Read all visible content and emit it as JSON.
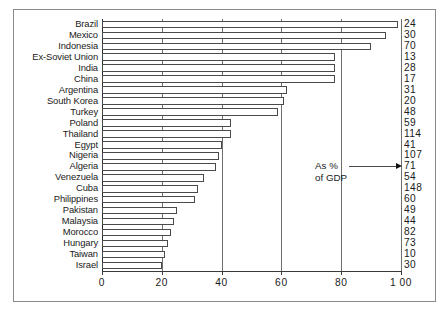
{
  "chart_data": {
    "type": "bar",
    "orientation": "horizontal",
    "title": "",
    "subtitle": "",
    "xlabel": "",
    "ylabel": "",
    "xlim": [
      0,
      100
    ],
    "grid": true,
    "gridlines_at": [
      0,
      20,
      40,
      60,
      80,
      100
    ],
    "xticks": [
      "0",
      "20",
      "40",
      "60",
      "80",
      "1 00"
    ],
    "xtick_values": [
      0,
      20,
      40,
      60,
      80,
      100
    ],
    "categories": [
      "Brazil",
      "Mexico",
      "Indonesia",
      "Ex-Soviet Union",
      "India",
      "China",
      "Argentina",
      "South Korea",
      "Turkey",
      "Poland",
      "Thailand",
      "Egypt",
      "Nigeria",
      "Algeria",
      "Venezuela",
      "Cuba",
      "Philippines",
      "Pakistan",
      "Malaysia",
      "Morocco",
      "Hungary",
      "Taiwan",
      "Israel"
    ],
    "values": [
      99,
      95,
      90,
      78,
      78,
      78,
      62,
      61,
      59,
      43,
      43,
      40,
      39,
      38,
      34,
      32,
      31,
      25,
      24,
      23,
      22,
      21,
      20
    ],
    "right_column_label": "",
    "right_column_values": [
      "24",
      "30",
      "70",
      "13",
      "28",
      "17",
      "31",
      "20",
      "48",
      "59",
      "114",
      "41",
      "107",
      "71",
      "54",
      "148",
      "60",
      "49",
      "44",
      "82",
      "73",
      "10",
      "30"
    ],
    "annotation": {
      "line1": "As %",
      "line2": "of GDP",
      "points_to": "right_column_values"
    }
  },
  "colors": {
    "bar_fill": "#ffffff",
    "bar_stroke": "#4a4a4a",
    "gridline": "#6f6f6f",
    "axis": "#3a3a3a",
    "frame": "#8a8a8a",
    "text": "#1a1a1a",
    "background": "#ffffff"
  }
}
